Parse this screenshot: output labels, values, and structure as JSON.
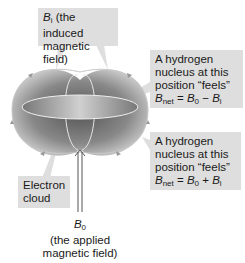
{
  "labels": {
    "induced": {
      "symbol": "B",
      "sub": "i",
      "text1": " (the induced",
      "text2": "magnetic field)"
    },
    "upper_nucleus": {
      "lines": [
        "A hydrogen",
        "nucleus at this",
        "position “feels”"
      ],
      "eq_sym": "B",
      "eq_sub": "net",
      "eq_mid": " = ",
      "eq_b0": "B",
      "eq_b0_sub": "0",
      "eq_op": " − ",
      "eq_bi": "B",
      "eq_bi_sub": "i"
    },
    "lower_nucleus": {
      "lines": [
        "A hydrogen",
        "nucleus at this",
        "position “feels”"
      ],
      "eq_sym": "B",
      "eq_sub": "net",
      "eq_mid": " = ",
      "eq_b0": "B",
      "eq_b0_sub": "0",
      "eq_op": " + ",
      "eq_bi": "B",
      "eq_bi_sub": "i"
    },
    "electron_cloud": {
      "line1": "Electron",
      "line2": "cloud"
    },
    "applied": {
      "symbol": "B",
      "sub": "0",
      "line1": "(the applied",
      "line2": "magnetic field)"
    }
  }
}
